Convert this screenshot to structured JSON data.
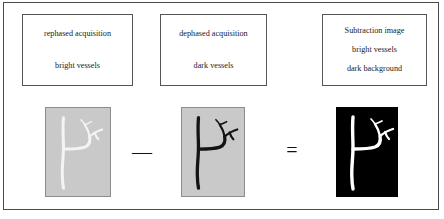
{
  "figure": {
    "frame_color": "#4a4a4a",
    "background": "#ffffff"
  },
  "captions": [
    {
      "name": "rephased",
      "lines": [
        "rephased acquisition",
        "bright vessels"
      ]
    },
    {
      "name": "dephased",
      "lines": [
        "dephased acquisition",
        "dark vessels"
      ]
    },
    {
      "name": "subtraction",
      "lines": [
        "Subtraction image",
        "bright vessels",
        "dark background"
      ]
    }
  ],
  "panels": [
    {
      "name": "rephased-image",
      "background_color": "#c9c9c9",
      "vessel_color": "#f2f2f2",
      "border_color": "#8c8c8c",
      "description": "bright vessels on gray background"
    },
    {
      "name": "dephased-image",
      "background_color": "#c9c9c9",
      "vessel_color": "#141414",
      "border_color": "#8c8c8c",
      "description": "dark vessels on gray background"
    },
    {
      "name": "subtraction-image",
      "background_color": "#000000",
      "vessel_color": "#ffffff",
      "border_color": "#000000",
      "description": "bright vessels on dark background"
    }
  ],
  "operators": {
    "minus": "—",
    "equals": "="
  }
}
